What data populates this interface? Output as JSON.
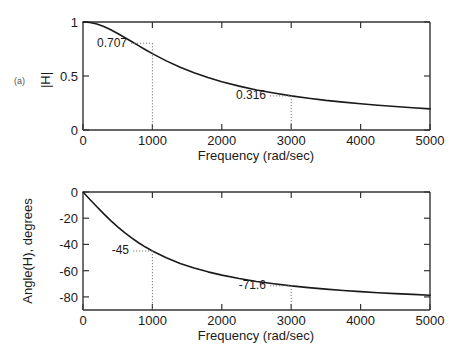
{
  "figure": {
    "background": "#ffffff",
    "ink": "#1a1a1a",
    "panels": [
      {
        "tag": "(a)",
        "ylabel": "|H|",
        "xlabel": "Frequency (rad/sec)",
        "ytick_labels": [
          "1",
          "0.5",
          "0"
        ],
        "ytick_values": [
          1,
          0.5,
          0
        ],
        "xtick_labels": [
          "0",
          "1000",
          "2000",
          "3000",
          "4000",
          "5000"
        ],
        "xtick_values": [
          0,
          1000,
          2000,
          3000,
          4000,
          5000
        ],
        "annotations": [
          {
            "label": "0.707",
            "x": 1000,
            "y": 0.707
          },
          {
            "label": "0.316",
            "x": 3000,
            "y": 0.316
          }
        ]
      },
      {
        "tag": "(b)",
        "ylabel": "Angle(H), degrees",
        "xlabel": "Frequency (rad/sec)",
        "ytick_labels": [
          "0",
          "-20",
          "-40",
          "-60",
          "-80"
        ],
        "ytick_values": [
          0,
          -20,
          -40,
          -60,
          -80
        ],
        "xtick_labels": [
          "0",
          "1000",
          "2000",
          "3000",
          "4000",
          "5000"
        ],
        "xtick_values": [
          0,
          1000,
          2000,
          3000,
          4000,
          5000
        ],
        "annotations": [
          {
            "label": "-45",
            "x": 1000,
            "y": -45
          },
          {
            "label": "-71.6",
            "x": 3000,
            "y": -71.6
          }
        ]
      }
    ]
  },
  "chart_data": [
    {
      "type": "line",
      "title": "",
      "subtitle": "",
      "panel": "(a)",
      "xlabel": "Frequency (rad/sec)",
      "ylabel": "|H|",
      "xlim": [
        0,
        5000
      ],
      "ylim": [
        0,
        1
      ],
      "xticks": [
        0,
        1000,
        2000,
        3000,
        4000,
        5000
      ],
      "yticks": [
        0,
        0.5,
        1
      ],
      "grid": false,
      "legend": null,
      "series": [
        {
          "name": "|H(w)|",
          "x": [
            0,
            100,
            200,
            300,
            400,
            500,
            600,
            700,
            800,
            900,
            1000,
            1200,
            1400,
            1600,
            1800,
            2000,
            2250,
            2500,
            2750,
            3000,
            3250,
            3500,
            3750,
            4000,
            4250,
            4500,
            4750,
            5000
          ],
          "y": [
            1.0,
            0.995,
            0.981,
            0.958,
            0.928,
            0.894,
            0.857,
            0.819,
            0.781,
            0.743,
            0.707,
            0.64,
            0.581,
            0.53,
            0.486,
            0.447,
            0.406,
            0.371,
            0.342,
            0.316,
            0.294,
            0.274,
            0.258,
            0.243,
            0.229,
            0.217,
            0.206,
            0.196
          ]
        }
      ],
      "annotations": [
        {
          "text": "0.316",
          "x": 3000,
          "y": 0.316
        },
        {
          "text": "0.707",
          "x": 1000,
          "y": 0.707
        }
      ]
    },
    {
      "type": "line",
      "title": "",
      "subtitle": "",
      "panel": "(b)",
      "xlabel": "Frequency (rad/sec)",
      "ylabel": "Angle(H), degrees",
      "xlim": [
        0,
        5000
      ],
      "ylim": [
        -90,
        0
      ],
      "xticks": [
        0,
        1000,
        2000,
        3000,
        4000,
        5000
      ],
      "yticks": [
        -80,
        -60,
        -40,
        -20,
        0
      ],
      "grid": false,
      "legend": null,
      "series": [
        {
          "name": "angle H(w)",
          "x": [
            0,
            100,
            200,
            300,
            400,
            500,
            600,
            700,
            800,
            900,
            1000,
            1200,
            1400,
            1600,
            1800,
            2000,
            2250,
            2500,
            2750,
            3000,
            3250,
            3500,
            3750,
            4000,
            4250,
            4500,
            4750,
            5000
          ],
          "y": [
            0,
            -5.7,
            -11.3,
            -16.7,
            -21.8,
            -26.6,
            -31.0,
            -35.0,
            -38.7,
            -42.0,
            -45.0,
            -50.2,
            -54.5,
            -58.0,
            -60.9,
            -63.4,
            -66.0,
            -68.2,
            -70.0,
            -71.6,
            -72.9,
            -74.1,
            -75.1,
            -76.0,
            -76.8,
            -77.5,
            -78.1,
            -78.7
          ]
        }
      ],
      "annotations": [
        {
          "text": "-45",
          "x": 1000,
          "y": -45
        },
        {
          "text": "-71.6",
          "x": 3000,
          "y": -71.6
        }
      ]
    }
  ]
}
